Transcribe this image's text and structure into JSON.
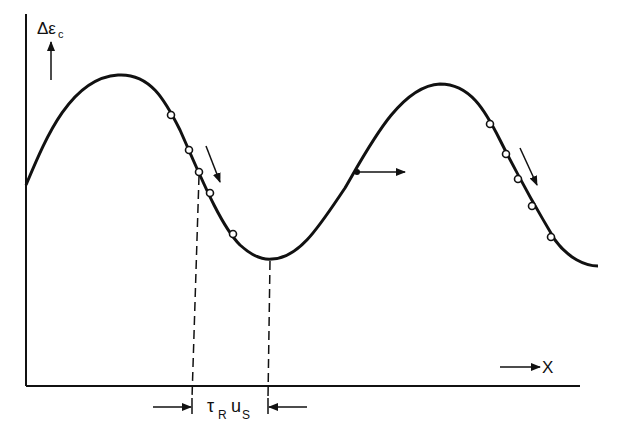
{
  "diagram": {
    "y_axis_label": "Δε",
    "y_axis_subscript": "c",
    "x_axis_label": "X",
    "span_label_tau": "τ",
    "span_label_tau_sub": "R",
    "span_label_u": "u",
    "span_label_u_sub": "S",
    "colors": {
      "ink": "#111111",
      "background": "#ffffff"
    },
    "curve": "sinusoidal wave of Δε_c versus X with two maxima and one minimum",
    "markers_left_group": 5,
    "markers_right_group": 5,
    "features": [
      "downward slope arrow near left descending segment",
      "horizontal propagation arrow at inflection point on rising segment",
      "downward slope arrow near right descending segment",
      "dashed vertical lines from curve to x-axis marking span τR·uS"
    ]
  }
}
